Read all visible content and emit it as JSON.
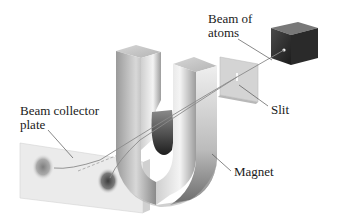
{
  "diagram": {
    "labels": {
      "beam_of_atoms": {
        "line1": "Beam of",
        "line2": "atoms"
      },
      "slit": "Slit",
      "magnet": "Magnet",
      "collector": {
        "line1": "Beam collector",
        "line2": "plate"
      }
    },
    "components": [
      "oven",
      "slit-plate",
      "magnet",
      "beam-collector-plate"
    ],
    "colors": {
      "oven_front": "#3a3a3a",
      "oven_top": "#6e6e6e",
      "oven_side": "#222222",
      "magnet_light": "#e8e8e8",
      "magnet_mid": "#a8a8a8",
      "magnet_dark": "#4a4a4a",
      "plate": "#e6e6e6",
      "spot": "#6a6a6a",
      "beam": "#9a9a9a",
      "leader": "#555555"
    }
  }
}
